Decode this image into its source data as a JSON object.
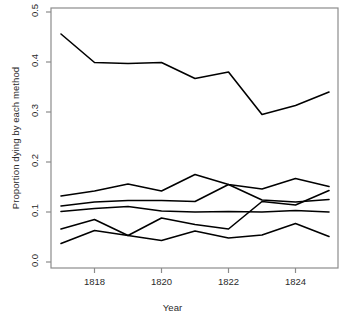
{
  "chart_data": {
    "type": "line",
    "title": "",
    "xlabel": "Year",
    "ylabel": "Proportion dying by each method",
    "x": [
      1817,
      1818,
      1819,
      1820,
      1821,
      1822,
      1823,
      1824,
      1825
    ],
    "xlim": [
      1817,
      1825
    ],
    "ylim": [
      0.0,
      0.5
    ],
    "xticks": [
      1818,
      1820,
      1822,
      1824
    ],
    "xtick_labels": [
      "1818",
      "1820",
      "1822",
      "1824"
    ],
    "yticks": [
      0.0,
      0.1,
      0.2,
      0.3,
      0.4,
      0.5
    ],
    "ytick_labels": [
      "0.0",
      "0.1",
      "0.2",
      "0.3",
      "0.4",
      "0.5"
    ],
    "grid": false,
    "legend": "none",
    "line_color": "#000000",
    "line_width": 1.6,
    "series": [
      {
        "name": "method-1",
        "values": [
          0.456,
          0.399,
          0.397,
          0.399,
          0.367,
          0.38,
          0.295,
          0.313,
          0.34
        ]
      },
      {
        "name": "method-2",
        "values": [
          0.132,
          0.142,
          0.156,
          0.142,
          0.175,
          0.155,
          0.146,
          0.167,
          0.151
        ]
      },
      {
        "name": "method-3",
        "values": [
          0.112,
          0.12,
          0.123,
          0.123,
          0.121,
          0.155,
          0.124,
          0.12,
          0.125
        ]
      },
      {
        "name": "method-4",
        "values": [
          0.101,
          0.107,
          0.111,
          0.102,
          0.1,
          0.101,
          0.1,
          0.103,
          0.1
        ]
      },
      {
        "name": "method-5",
        "values": [
          0.066,
          0.085,
          0.053,
          0.088,
          0.075,
          0.066,
          0.121,
          0.114,
          0.143
        ]
      },
      {
        "name": "method-6",
        "values": [
          0.037,
          0.063,
          0.053,
          0.043,
          0.062,
          0.048,
          0.054,
          0.077,
          0.051
        ]
      }
    ]
  }
}
